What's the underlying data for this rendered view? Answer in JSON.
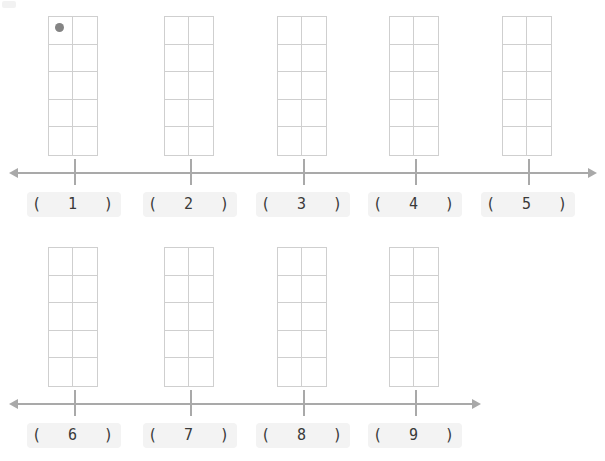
{
  "page": {
    "background_color": "#ffffff",
    "width": 605,
    "height": 461
  },
  "style": {
    "grid_line_color": "#cfcfcf",
    "axis_color": "#a9a9a9",
    "dot_color": "#848484",
    "label_chip_color": "#f3f3f3",
    "label_text_color": "#3a3a3a"
  },
  "grid_spec": {
    "columns": 2,
    "rows": 5,
    "total_cells": 10,
    "width_px": 50,
    "height_px": 140
  },
  "rows": [
    {
      "name": "row-1",
      "axis": {
        "left": 18,
        "right": 588,
        "double_headed": true
      },
      "items": [
        {
          "number": "1",
          "label": "(  1  )",
          "x": 48,
          "tick_x": 74,
          "label_x": 27,
          "dot": true
        },
        {
          "number": "2",
          "label": "(  2  )",
          "x": 164,
          "tick_x": 190,
          "label_x": 143,
          "dot": false
        },
        {
          "number": "3",
          "label": "(  3  )",
          "x": 277,
          "tick_x": 303,
          "label_x": 256,
          "dot": false
        },
        {
          "number": "4",
          "label": "(  4  )",
          "x": 389,
          "tick_x": 415,
          "label_x": 368,
          "dot": false
        },
        {
          "number": "5",
          "label": "(  5  )",
          "x": 502,
          "tick_x": 528,
          "label_x": 481,
          "dot": false
        }
      ]
    },
    {
      "name": "row-2",
      "axis": {
        "left": 18,
        "right": 472,
        "double_headed": true
      },
      "items": [
        {
          "number": "6",
          "label": "(  6  )",
          "x": 48,
          "tick_x": 74,
          "label_x": 27,
          "dot": false
        },
        {
          "number": "7",
          "label": "(  7  )",
          "x": 164,
          "tick_x": 190,
          "label_x": 143,
          "dot": false
        },
        {
          "number": "8",
          "label": "(  8  )",
          "x": 277,
          "tick_x": 303,
          "label_x": 256,
          "dot": false
        },
        {
          "number": "9",
          "label": "(  9  )",
          "x": 389,
          "tick_x": 415,
          "label_x": 368,
          "dot": false
        }
      ]
    }
  ]
}
